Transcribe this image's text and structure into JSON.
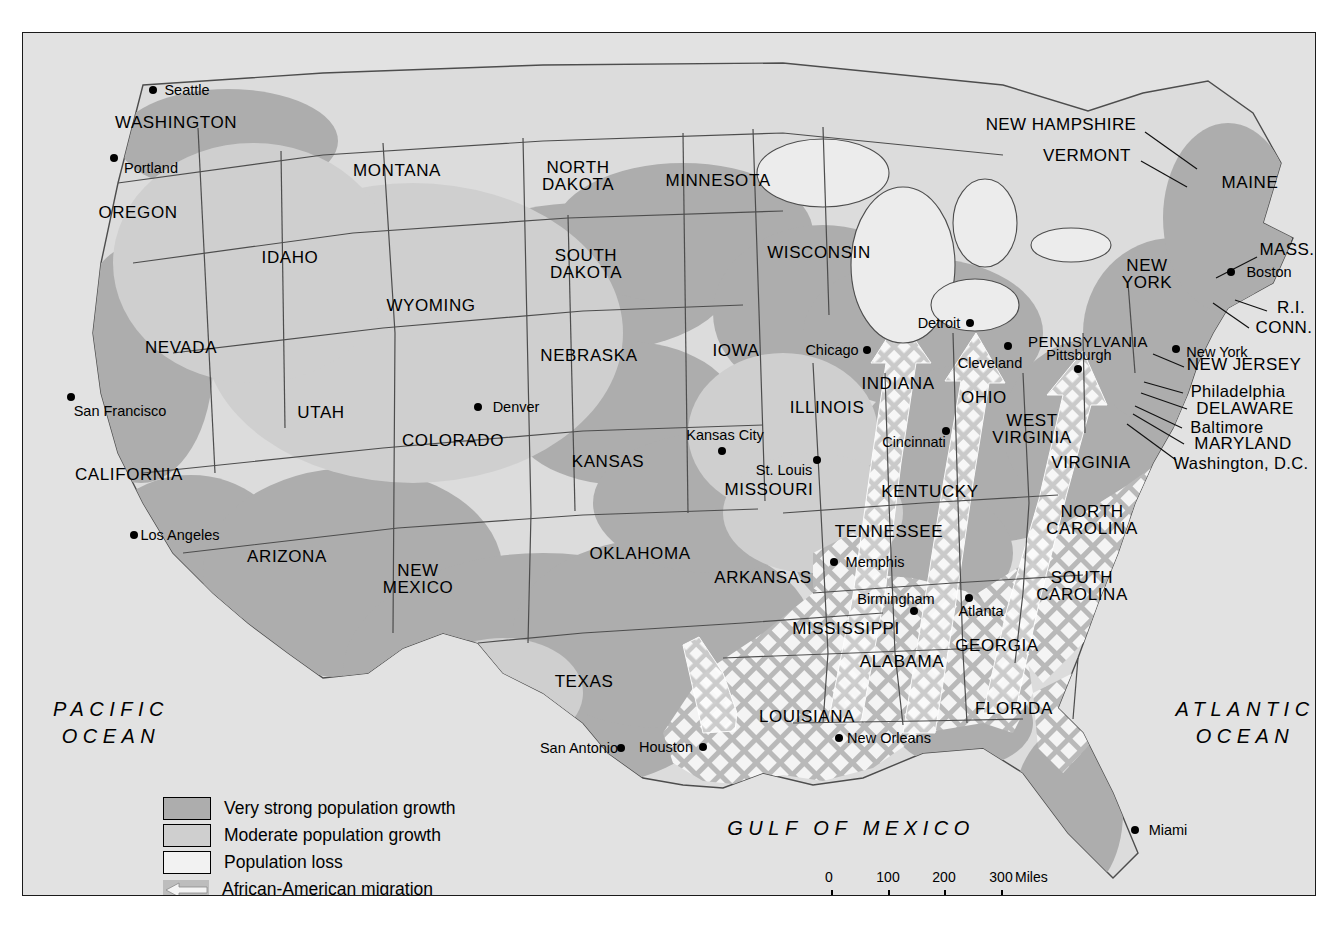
{
  "map": {
    "title": "United States population change and African-American migration",
    "colors": {
      "very_strong": "#adadad",
      "moderate": "#cfcfcf",
      "population_loss": "#f2f2f2",
      "migration": "#bdbdbd",
      "ocean": "#e2e2e2",
      "land": "#dcdcdc",
      "border": "#555555",
      "frame": "#1b1b1b",
      "text": "#000000"
    },
    "oceans": [
      {
        "name": "pacific-ocean-label",
        "line1": "PACIFIC",
        "line2": "OCEAN",
        "x": 88,
        "y": 690
      },
      {
        "name": "atlantic-ocean-label",
        "line1": "ATLANTIC",
        "line2": "OCEAN",
        "x": 1222,
        "y": 690
      },
      {
        "name": "gulf-of-mexico-label",
        "line1": "GULF OF MEXICO",
        "line2": "",
        "x": 828,
        "y": 795
      }
    ],
    "states": [
      {
        "name": "washington",
        "label": "WASHINGTON",
        "x": 175,
        "y": 122
      },
      {
        "name": "oregon",
        "label": "OREGON",
        "x": 137,
        "y": 212
      },
      {
        "name": "idaho",
        "label": "IDAHO",
        "x": 289,
        "y": 257
      },
      {
        "name": "montana",
        "label": "MONTANA",
        "x": 396,
        "y": 170
      },
      {
        "name": "wyoming",
        "label": "WYOMING",
        "x": 430,
        "y": 305
      },
      {
        "name": "nevada",
        "label": "NEVADA",
        "x": 180,
        "y": 347
      },
      {
        "name": "california",
        "label": "CALIFORNIA",
        "x": 128,
        "y": 474
      },
      {
        "name": "utah",
        "label": "UTAH",
        "x": 320,
        "y": 412
      },
      {
        "name": "arizona",
        "label": "ARIZONA",
        "x": 286,
        "y": 556
      },
      {
        "name": "colorado",
        "label": "COLORADO",
        "x": 452,
        "y": 440
      },
      {
        "name": "new-mexico",
        "label": "NEW\nMEXICO",
        "x": 417,
        "y": 578
      },
      {
        "name": "north-dakota",
        "label": "NORTH\nDAKOTA",
        "x": 577,
        "y": 175
      },
      {
        "name": "south-dakota",
        "label": "SOUTH\nDAKOTA",
        "x": 585,
        "y": 263
      },
      {
        "name": "nebraska",
        "label": "NEBRASKA",
        "x": 588,
        "y": 355
      },
      {
        "name": "kansas",
        "label": "KANSAS",
        "x": 607,
        "y": 461
      },
      {
        "name": "oklahoma",
        "label": "OKLAHOMA",
        "x": 639,
        "y": 553
      },
      {
        "name": "texas",
        "label": "TEXAS",
        "x": 583,
        "y": 681
      },
      {
        "name": "minnesota",
        "label": "MINNESOTA",
        "x": 717,
        "y": 180
      },
      {
        "name": "iowa",
        "label": "IOWA",
        "x": 735,
        "y": 350
      },
      {
        "name": "missouri",
        "label": "MISSOURI",
        "x": 768,
        "y": 489
      },
      {
        "name": "arkansas",
        "label": "ARKANSAS",
        "x": 762,
        "y": 577
      },
      {
        "name": "louisiana",
        "label": "LOUISIANA",
        "x": 806,
        "y": 716
      },
      {
        "name": "wisconsin",
        "label": "WISCONSIN",
        "x": 818,
        "y": 252
      },
      {
        "name": "illinois",
        "label": "ILLINOIS",
        "x": 826,
        "y": 407
      },
      {
        "name": "mississippi",
        "label": "MISSISSIPPI",
        "x": 845,
        "y": 628
      },
      {
        "name": "indiana",
        "label": "INDIANA",
        "x": 897,
        "y": 383
      },
      {
        "name": "tennessee",
        "label": "TENNESSEE",
        "x": 888,
        "y": 531
      },
      {
        "name": "alabama",
        "label": "ALABAMA",
        "x": 901,
        "y": 661
      },
      {
        "name": "kentucky",
        "label": "KENTUCKY",
        "x": 929,
        "y": 491
      },
      {
        "name": "ohio",
        "label": "OHIO",
        "x": 983,
        "y": 397
      },
      {
        "name": "west-virginia",
        "label": "WEST\nVIRGINIA",
        "x": 1031,
        "y": 428
      },
      {
        "name": "georgia",
        "label": "GEORGIA",
        "x": 996,
        "y": 645
      },
      {
        "name": "florida",
        "label": "FLORIDA",
        "x": 1013,
        "y": 708
      },
      {
        "name": "south-carolina",
        "label": "SOUTH\nCAROLINA",
        "x": 1081,
        "y": 585
      },
      {
        "name": "north-carolina",
        "label": "NORTH\nCAROLINA",
        "x": 1091,
        "y": 519
      },
      {
        "name": "virginia",
        "label": "VIRGINIA",
        "x": 1090,
        "y": 462
      },
      {
        "name": "pennsylvania",
        "label": "PENNSYLVANIA",
        "x": 1087,
        "y": 340
      },
      {
        "name": "new-york",
        "label": "NEW\nYORK",
        "x": 1146,
        "y": 273
      },
      {
        "name": "maine",
        "label": "MAINE",
        "x": 1249,
        "y": 182
      }
    ],
    "callouts": [
      {
        "name": "new-hampshire",
        "label": "NEW HAMPSHIRE",
        "x": 1060,
        "y": 124,
        "line": [
          1144,
          131,
          1196,
          168
        ]
      },
      {
        "name": "vermont",
        "label": "VERMONT",
        "x": 1086,
        "y": 155,
        "line": [
          1140,
          160,
          1186,
          186
        ]
      },
      {
        "name": "mass",
        "label": "MASS.",
        "x": 1286,
        "y": 249,
        "line": [
          1256,
          256,
          1215,
          277
        ]
      },
      {
        "name": "ri",
        "label": "R.I.",
        "x": 1290,
        "y": 307,
        "line": [
          1266,
          310,
          1234,
          299
        ]
      },
      {
        "name": "conn",
        "label": "CONN.",
        "x": 1283,
        "y": 327,
        "line": [
          1248,
          327,
          1212,
          302
        ]
      },
      {
        "name": "new-jersey",
        "label": "NEW JERSEY",
        "x": 1243,
        "y": 364,
        "line": [
          1183,
          366,
          1152,
          353
        ]
      },
      {
        "name": "delaware",
        "label": "DELAWARE",
        "x": 1244,
        "y": 408,
        "line": [
          1186,
          408,
          1140,
          392
        ]
      },
      {
        "name": "maryland",
        "label": "MARYLAND",
        "x": 1242,
        "y": 443,
        "line": [
          1183,
          443,
          1132,
          413
        ]
      },
      {
        "name": "washington-dc",
        "label": "Washington, D.C.",
        "x": 1240,
        "y": 462,
        "line": [
          1175,
          459,
          1126,
          423
        ]
      },
      {
        "name": "philadelphia",
        "label": "Philadelphia",
        "x": 1237,
        "y": 390,
        "line": [
          1182,
          392,
          1143,
          381
        ]
      },
      {
        "name": "baltimore",
        "label": "Baltimore",
        "x": 1226,
        "y": 426,
        "line": [
          1181,
          427,
          1134,
          405
        ]
      }
    ],
    "cities": [
      {
        "name": "seattle",
        "label": "Seattle",
        "dx": 152,
        "dy": 89,
        "lx": 186,
        "ly": 89
      },
      {
        "name": "portland",
        "label": "Portland",
        "dx": 113,
        "dy": 157,
        "lx": 150,
        "ly": 167
      },
      {
        "name": "san-francisco",
        "label": "San Francisco",
        "dx": 70,
        "dy": 396,
        "lx": 119,
        "ly": 410
      },
      {
        "name": "los-angeles",
        "label": "Los Angeles",
        "dx": 133,
        "dy": 534,
        "lx": 179,
        "ly": 534
      },
      {
        "name": "denver",
        "label": "Denver",
        "dx": 477,
        "dy": 406,
        "lx": 515,
        "ly": 406
      },
      {
        "name": "kansas-city",
        "label": "Kansas City",
        "dx": 721,
        "dy": 450,
        "lx": 724,
        "ly": 434
      },
      {
        "name": "st-louis",
        "label": "St. Louis",
        "dx": 816,
        "dy": 459,
        "lx": 783,
        "ly": 469
      },
      {
        "name": "chicago",
        "label": "Chicago",
        "dx": 866,
        "dy": 349,
        "lx": 831,
        "ly": 349
      },
      {
        "name": "detroit",
        "label": "Detroit",
        "dx": 969,
        "dy": 322,
        "lx": 938,
        "ly": 322
      },
      {
        "name": "cleveland",
        "label": "Cleveland",
        "dx": 1007,
        "dy": 345,
        "lx": 989,
        "ly": 362
      },
      {
        "name": "cincinnati",
        "label": "Cincinnati",
        "dx": 945,
        "dy": 430,
        "lx": 913,
        "ly": 441
      },
      {
        "name": "pittsburgh",
        "label": "Pittsburgh",
        "dx": 1077,
        "dy": 368,
        "lx": 1078,
        "ly": 354
      },
      {
        "name": "new-york-city",
        "label": "New York",
        "dx": 1175,
        "dy": 348,
        "lx": 1216,
        "ly": 351
      },
      {
        "name": "boston",
        "label": "Boston",
        "dx": 1230,
        "dy": 271,
        "lx": 1268,
        "ly": 271
      },
      {
        "name": "memphis",
        "label": "Memphis",
        "dx": 833,
        "dy": 561,
        "lx": 874,
        "ly": 561
      },
      {
        "name": "birmingham",
        "label": "Birmingham",
        "dx": 913,
        "dy": 610,
        "lx": 895,
        "ly": 598
      },
      {
        "name": "atlanta",
        "label": "Atlanta",
        "dx": 968,
        "dy": 597,
        "lx": 980,
        "ly": 610
      },
      {
        "name": "new-orleans",
        "label": "New Orleans",
        "dx": 838,
        "dy": 737,
        "lx": 888,
        "ly": 737
      },
      {
        "name": "houston",
        "label": "Houston",
        "dx": 702,
        "dy": 746,
        "lx": 665,
        "ly": 746
      },
      {
        "name": "san-antonio",
        "label": "San Antonio",
        "dx": 620,
        "dy": 747,
        "lx": 578,
        "ly": 747
      },
      {
        "name": "miami",
        "label": "Miami",
        "dx": 1134,
        "dy": 829,
        "lx": 1167,
        "ly": 829
      }
    ],
    "legend": {
      "title": "Map legend",
      "items": [
        {
          "name": "very-strong-growth",
          "label": "Very strong population growth",
          "swatch": "vs"
        },
        {
          "name": "moderate-growth",
          "label": "Moderate population growth",
          "swatch": "mo"
        },
        {
          "name": "population-loss",
          "label": "Population loss",
          "swatch": "pl"
        },
        {
          "name": "african-american-migration",
          "label": "African-American migration",
          "swatch": "mg"
        }
      ]
    },
    "scale": {
      "miles": {
        "unit": "Miles",
        "ticks": [
          "0",
          "100",
          "200",
          "300"
        ]
      },
      "kilometers": {
        "unit": "Kilometers",
        "ticks": [
          "0",
          "100",
          "200",
          "300"
        ]
      }
    }
  }
}
